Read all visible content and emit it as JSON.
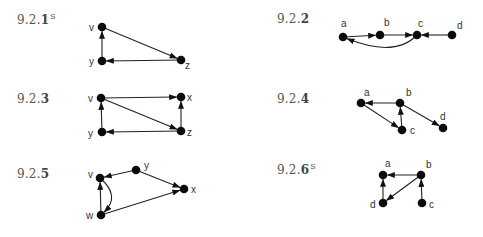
{
  "exercises": [
    {
      "id": "9.2.1",
      "prefix": "9.2.",
      "number": "1",
      "superscript": "S",
      "label_pos": [
        17,
        12
      ],
      "nodes": [
        {
          "name": "v",
          "x": 102,
          "y": 27,
          "lx": 89,
          "ly": 31
        },
        {
          "name": "y",
          "x": 102,
          "y": 61,
          "lx": 89,
          "ly": 65
        },
        {
          "name": "z",
          "x": 181,
          "y": 60,
          "lx": 185,
          "ly": 69
        }
      ],
      "edges": [
        {
          "from": "v",
          "to": "z"
        },
        {
          "from": "z",
          "to": "y"
        },
        {
          "from": "y",
          "to": "v"
        }
      ]
    },
    {
      "id": "9.2.2",
      "prefix": "9.2.",
      "number": "2",
      "superscript": "",
      "label_pos": [
        277,
        12
      ],
      "nodes": [
        {
          "name": "a",
          "x": 343,
          "y": 37,
          "lx": 341,
          "ly": 27
        },
        {
          "name": "b",
          "x": 380,
          "y": 35,
          "lx": 384,
          "ly": 26
        },
        {
          "name": "c",
          "x": 417,
          "y": 35,
          "lx": 418,
          "ly": 27
        },
        {
          "name": "d",
          "x": 452,
          "y": 35,
          "lx": 457,
          "ly": 29
        }
      ],
      "edges": [
        {
          "from": "a",
          "to": "b"
        },
        {
          "from": "b",
          "to": "c"
        },
        {
          "from": "d",
          "to": "c"
        },
        {
          "from": "c",
          "to": "a",
          "curve": [
            395,
            58
          ]
        }
      ]
    },
    {
      "id": "9.2.3",
      "prefix": "9.2.",
      "number": "3",
      "superscript": "",
      "label_pos": [
        17,
        92
      ],
      "nodes": [
        {
          "name": "v",
          "x": 101,
          "y": 98,
          "lx": 88,
          "ly": 102
        },
        {
          "name": "x",
          "x": 181,
          "y": 97,
          "lx": 187,
          "ly": 101
        },
        {
          "name": "y",
          "x": 102,
          "y": 132,
          "lx": 88,
          "ly": 137
        },
        {
          "name": "z",
          "x": 181,
          "y": 131,
          "lx": 187,
          "ly": 136
        }
      ],
      "edges": [
        {
          "from": "v",
          "to": "x"
        },
        {
          "from": "v",
          "to": "z"
        },
        {
          "from": "z",
          "to": "x"
        },
        {
          "from": "z",
          "to": "y"
        },
        {
          "from": "y",
          "to": "v"
        }
      ]
    },
    {
      "id": "9.2.4",
      "prefix": "9.2.",
      "number": "4",
      "superscript": "",
      "label_pos": [
        277,
        92
      ],
      "nodes": [
        {
          "name": "a",
          "x": 361,
          "y": 103,
          "lx": 364,
          "ly": 96
        },
        {
          "name": "b",
          "x": 400,
          "y": 103,
          "lx": 406,
          "ly": 96
        },
        {
          "name": "c",
          "x": 402,
          "y": 130,
          "lx": 410,
          "ly": 134
        },
        {
          "name": "d",
          "x": 443,
          "y": 128,
          "lx": 440,
          "ly": 120
        }
      ],
      "edges": [
        {
          "from": "b",
          "to": "a"
        },
        {
          "from": "a",
          "to": "c"
        },
        {
          "from": "c",
          "to": "b"
        },
        {
          "from": "b",
          "to": "d"
        }
      ]
    },
    {
      "id": "9.2.5",
      "prefix": "9.2.",
      "number": "5",
      "superscript": "",
      "label_pos": [
        17,
        167
      ],
      "nodes": [
        {
          "name": "v",
          "x": 100,
          "y": 178,
          "lx": 88,
          "ly": 178
        },
        {
          "name": "y",
          "x": 136,
          "y": 170,
          "lx": 144,
          "ly": 169
        },
        {
          "name": "x",
          "x": 184,
          "y": 189,
          "lx": 191,
          "ly": 193
        },
        {
          "name": "w",
          "x": 101,
          "y": 215,
          "lx": 86,
          "ly": 219
        }
      ],
      "edges": [
        {
          "from": "y",
          "to": "v"
        },
        {
          "from": "y",
          "to": "x"
        },
        {
          "from": "w",
          "to": "x"
        },
        {
          "from": "w",
          "to": "v"
        },
        {
          "from": "v",
          "to": "w",
          "curve": [
            121,
            196
          ]
        }
      ]
    },
    {
      "id": "9.2.6",
      "prefix": "9.2.",
      "number": "6",
      "superscript": "S",
      "label_pos": [
        277,
        162
      ],
      "nodes": [
        {
          "name": "a",
          "x": 383,
          "y": 175,
          "lx": 385,
          "ly": 167
        },
        {
          "name": "b",
          "x": 421,
          "y": 175,
          "lx": 426,
          "ly": 168
        },
        {
          "name": "d",
          "x": 383,
          "y": 203,
          "lx": 370,
          "ly": 208
        },
        {
          "name": "c",
          "x": 422,
          "y": 203,
          "lx": 429,
          "ly": 208
        }
      ],
      "edges": [
        {
          "from": "b",
          "to": "a"
        },
        {
          "from": "d",
          "to": "a"
        },
        {
          "from": "b",
          "to": "d"
        },
        {
          "from": "c",
          "to": "b"
        }
      ]
    }
  ]
}
